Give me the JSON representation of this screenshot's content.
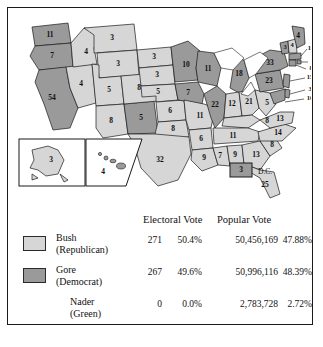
{
  "figure": {
    "dc_label": "D.C."
  },
  "colors": {
    "bush_fill": "#d6d6d6",
    "gore_fill": "#9a9a9a",
    "stroke": "#1a1a1a",
    "water": "#ffffff"
  },
  "map": {
    "dc": {
      "name": "District of Columbia",
      "label": "D.C.",
      "electoral": "3",
      "winner": "gore"
    },
    "states": [
      {
        "code": "WA",
        "electoral": "11",
        "winner": "gore"
      },
      {
        "code": "OR",
        "electoral": "7",
        "winner": "gore"
      },
      {
        "code": "CA",
        "electoral": "54",
        "winner": "gore"
      },
      {
        "code": "NV",
        "electoral": "4",
        "winner": "bush"
      },
      {
        "code": "ID",
        "electoral": "4",
        "winner": "bush"
      },
      {
        "code": "MT",
        "electoral": "3",
        "winner": "bush"
      },
      {
        "code": "WY",
        "electoral": "3",
        "winner": "bush"
      },
      {
        "code": "UT",
        "electoral": "5",
        "winner": "bush"
      },
      {
        "code": "AZ",
        "electoral": "8",
        "winner": "bush"
      },
      {
        "code": "NM",
        "electoral": "5",
        "winner": "gore"
      },
      {
        "code": "CO",
        "electoral": "8",
        "winner": "bush"
      },
      {
        "code": "ND",
        "electoral": "3",
        "winner": "bush"
      },
      {
        "code": "SD",
        "electoral": "3",
        "winner": "bush"
      },
      {
        "code": "NE",
        "electoral": "5",
        "winner": "bush"
      },
      {
        "code": "KS",
        "electoral": "6",
        "winner": "bush"
      },
      {
        "code": "OK",
        "electoral": "8",
        "winner": "bush"
      },
      {
        "code": "TX",
        "electoral": "32",
        "winner": "bush"
      },
      {
        "code": "MN",
        "electoral": "10",
        "winner": "gore"
      },
      {
        "code": "IA",
        "electoral": "7",
        "winner": "gore"
      },
      {
        "code": "MO",
        "electoral": "11",
        "winner": "bush"
      },
      {
        "code": "AR",
        "electoral": "6",
        "winner": "bush"
      },
      {
        "code": "LA",
        "electoral": "9",
        "winner": "bush"
      },
      {
        "code": "WI",
        "electoral": "11",
        "winner": "gore"
      },
      {
        "code": "IL",
        "electoral": "22",
        "winner": "gore"
      },
      {
        "code": "MS",
        "electoral": "7",
        "winner": "bush"
      },
      {
        "code": "AL",
        "electoral": "9",
        "winner": "bush"
      },
      {
        "code": "MI",
        "electoral": "18",
        "winner": "gore"
      },
      {
        "code": "IN",
        "electoral": "12",
        "winner": "bush"
      },
      {
        "code": "OH",
        "electoral": "21",
        "winner": "bush"
      },
      {
        "code": "KY",
        "electoral": "8",
        "winner": "bush"
      },
      {
        "code": "TN",
        "electoral": "11",
        "winner": "bush"
      },
      {
        "code": "GA",
        "electoral": "13",
        "winner": "bush"
      },
      {
        "code": "FL",
        "electoral": "25",
        "winner": "bush"
      },
      {
        "code": "SC",
        "electoral": "8",
        "winner": "bush"
      },
      {
        "code": "NC",
        "electoral": "14",
        "winner": "bush"
      },
      {
        "code": "VA",
        "electoral": "13",
        "winner": "bush"
      },
      {
        "code": "WV",
        "electoral": "5",
        "winner": "bush"
      },
      {
        "code": "PA",
        "electoral": "23",
        "winner": "gore"
      },
      {
        "code": "NY",
        "electoral": "33",
        "winner": "gore"
      },
      {
        "code": "VT",
        "electoral": "3",
        "winner": "gore"
      },
      {
        "code": "NH",
        "electoral": "4",
        "winner": "bush"
      },
      {
        "code": "ME",
        "electoral": "4",
        "winner": "gore"
      },
      {
        "code": "MA",
        "electoral": "12",
        "winner": "gore"
      },
      {
        "code": "RI",
        "electoral": "4",
        "winner": "gore"
      },
      {
        "code": "CT",
        "electoral": "8",
        "winner": "gore"
      },
      {
        "code": "NJ",
        "electoral": "15",
        "winner": "gore"
      },
      {
        "code": "DE",
        "electoral": "3",
        "winner": "gore"
      },
      {
        "code": "MD",
        "electoral": "10",
        "winner": "gore"
      },
      {
        "code": "AK",
        "electoral": "3",
        "winner": "bush"
      },
      {
        "code": "HI",
        "electoral": "4",
        "winner": "gore"
      }
    ]
  },
  "table": {
    "headers": {
      "electoral_vote": "Electoral Vote",
      "popular_vote": "Popular Vote"
    },
    "rows": [
      {
        "candidate": "Bush",
        "party": "(Republican)",
        "swatch": "bush",
        "electoral_votes": "271",
        "electoral_pct": "50.4%",
        "popular_votes": "50,456,169",
        "popular_pct": "47.88%"
      },
      {
        "candidate": "Gore",
        "party": "(Democrat)",
        "swatch": "gore",
        "electoral_votes": "267",
        "electoral_pct": "49.6%",
        "popular_votes": "50,996,116",
        "popular_pct": "48.39%"
      },
      {
        "candidate": "Nader",
        "party": "(Green)",
        "swatch": "none",
        "electoral_votes": "0",
        "electoral_pct": "0.0%",
        "popular_votes": "2,783,728",
        "popular_pct": "2.72%"
      }
    ]
  }
}
